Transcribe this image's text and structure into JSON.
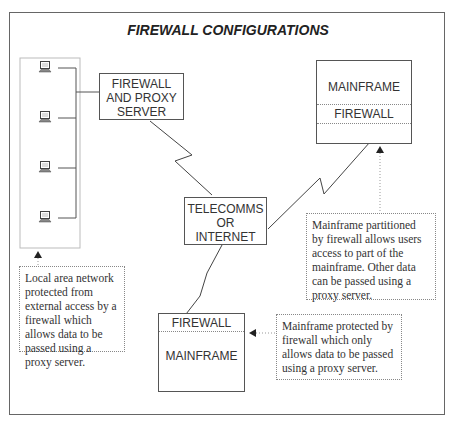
{
  "title": "FIREWALL CONFIGURATIONS",
  "nodes": {
    "proxy_server": {
      "lines": [
        "FIREWALL",
        "AND PROXY",
        "SERVER"
      ]
    },
    "telecomms": {
      "lines": [
        "TELECOMMS",
        "OR",
        "INTERNET"
      ]
    },
    "mainframe_top": {
      "top_label": "MAINFRAME",
      "middle_label": "FIREWALL"
    },
    "mainframe_bottom": {
      "top_label": "FIREWALL",
      "bottom_label": "MAINFRAME"
    }
  },
  "lan": {
    "workstation_count": 4,
    "icon": "laptop-icon"
  },
  "notes": {
    "lan": "Local area network protected from external access by a firewall which allows data to be passed using a proxy server.",
    "partitioned": "Mainframe partitioned by firewall allows users access to part of the mainframe. Other data can be passed using a proxy server.",
    "protected": "Mainframe protected by firewall which only allows data to be passed using a proxy server."
  }
}
